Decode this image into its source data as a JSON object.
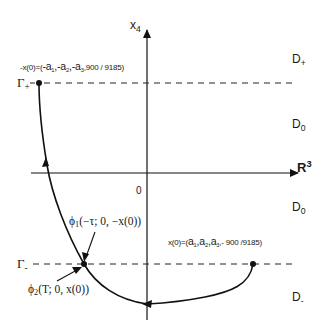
{
  "diagram": {
    "axes": {
      "vertical_label": {
        "main": "x",
        "sub": "4"
      },
      "horizontal_label": {
        "main": "R",
        "sup": "3"
      },
      "origin_label": "0"
    },
    "levels": {
      "gamma_plus": {
        "main": "Γ",
        "sub": "+"
      },
      "gamma_minus": {
        "main": "Γ",
        "sub": "-"
      }
    },
    "regions": {
      "d_plus": {
        "main": "D",
        "sub": "+"
      },
      "d0_upper": {
        "main": "D",
        "sub": "0"
      },
      "d0_lower": {
        "main": "D",
        "sub": "0"
      },
      "d_minus": {
        "main": "D",
        "sub": "-"
      }
    },
    "points": {
      "neg_x0": {
        "prefix": "-x(0)=(",
        "a1": "-a",
        "a1_sub": "1",
        "sep1": ",",
        "a2": "-a",
        "a2_sub": "2",
        "sep2": ",",
        "a3": "-a",
        "a3_sub": "3",
        "tail": ",900 / 9185)"
      },
      "x0": {
        "prefix": "x(0)=(",
        "a1": "a",
        "a1_sub": "1",
        "sep1": ",",
        "a2": "a",
        "a2_sub": "2",
        "sep2": ",",
        "a3": "a",
        "a3_sub": "3",
        "tail": ",- 900 /9185)"
      }
    },
    "annotations": {
      "phi1": {
        "main": "ϕ",
        "sub": "1",
        "args": "(−τ; 0, −x(0))"
      },
      "phi2": {
        "main": "ϕ",
        "sub": "2",
        "args": "(T; 0, x(0))"
      }
    },
    "colors": {
      "ink": "#111111",
      "background": "#ffffff"
    }
  }
}
